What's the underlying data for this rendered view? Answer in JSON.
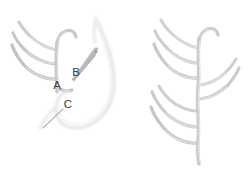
{
  "figure": {
    "background_color": "#ffffff",
    "thread_color": "#c9c9c9",
    "thread_color_light": "#dcdcdc",
    "thread_color_dark": "#b0b0b0",
    "needle_color": "#a8a8a8",
    "label_color": "#3a3a3a",
    "leader_color": "#b8b8b8"
  },
  "labels": [
    {
      "id": "A",
      "text": "A",
      "x": 57,
      "y": 86,
      "meaning": "stitch-start-point"
    },
    {
      "id": "B",
      "text": "B",
      "x": 76,
      "y": 73,
      "meaning": "needle-entry-point"
    },
    {
      "id": "C",
      "text": "C",
      "x": 68,
      "y": 105,
      "meaning": "needle-exit-point"
    }
  ],
  "leaders": [
    {
      "id": "leader-b",
      "from_x": 80,
      "from_y": 72,
      "to_x": 96,
      "to_y": 55
    },
    {
      "id": "leader-c",
      "from_x": 63,
      "from_y": 108,
      "to_x": 43,
      "to_y": 127
    }
  ],
  "panels": [
    {
      "id": "left-panel",
      "name": "stitch-in-progress",
      "caption": "",
      "spine": {
        "x": 57,
        "top_y": 42,
        "bottom_y": 92
      },
      "branches": [
        {
          "side": "left",
          "length": "long",
          "anchor_y": 50
        },
        {
          "side": "left",
          "length": "long",
          "anchor_y": 64
        },
        {
          "side": "left",
          "length": "long",
          "anchor_y": 78
        },
        {
          "side": "right",
          "length": "short",
          "anchor_y": 44
        },
        {
          "side": "right",
          "length": "short",
          "anchor_y": 88
        }
      ],
      "needle": {
        "tip_x": 71,
        "tip_y": 78,
        "eye_x": 96,
        "eye_y": 46,
        "angle_deg": -52
      },
      "working_thread_loop": true
    },
    {
      "id": "right-panel",
      "name": "completed-stitch",
      "caption": "",
      "spine": {
        "x": 199,
        "top_y": 38,
        "bottom_y": 164
      },
      "branches": [
        {
          "side": "left",
          "length": "long",
          "anchor_y": 48
        },
        {
          "side": "left",
          "length": "long",
          "anchor_y": 62
        },
        {
          "side": "left",
          "length": "long",
          "anchor_y": 76
        },
        {
          "side": "right",
          "length": "long",
          "anchor_y": 84
        },
        {
          "side": "right",
          "length": "long",
          "anchor_y": 98
        },
        {
          "side": "left",
          "length": "long",
          "anchor_y": 108
        },
        {
          "side": "left",
          "length": "long",
          "anchor_y": 122
        },
        {
          "side": "left",
          "length": "long",
          "anchor_y": 136
        },
        {
          "side": "right",
          "length": "short",
          "anchor_y": 42
        }
      ]
    }
  ]
}
